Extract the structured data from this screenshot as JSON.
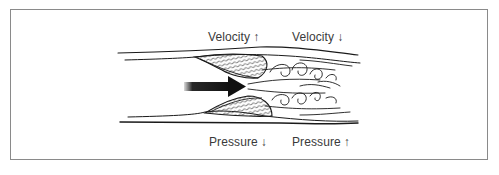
{
  "figure": {
    "type": "diagram",
    "labels": {
      "top_left": {
        "text": "Velocity",
        "arrow": "↑"
      },
      "top_right": {
        "text": "Velocity",
        "arrow": "↓"
      },
      "bottom_left": {
        "text": "Pressure",
        "arrow": "↓"
      },
      "bottom_right": {
        "text": "Pressure",
        "arrow": "↑"
      }
    },
    "colors": {
      "frame": "#8a8a8a",
      "ink": "#1a1a1a",
      "label": "#3a3a3a",
      "background": "#ffffff"
    }
  }
}
